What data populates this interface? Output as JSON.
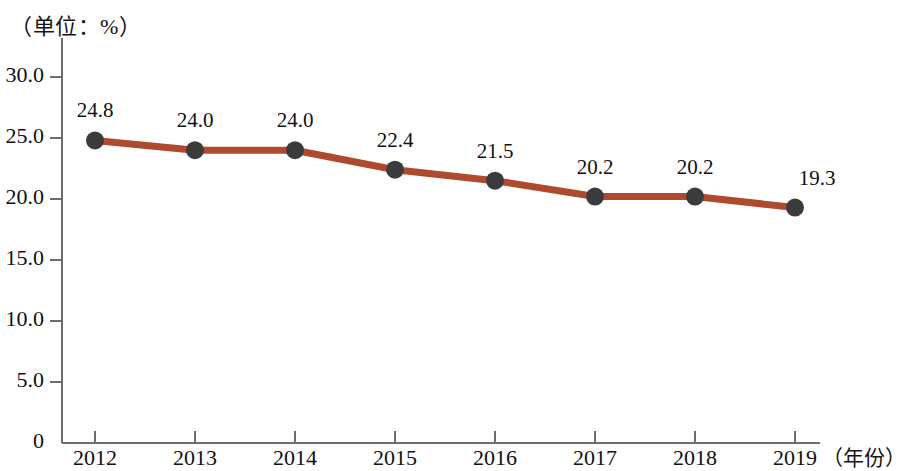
{
  "chart_data": {
    "type": "line",
    "title": "（单位：%）",
    "xlabel": "（年份）",
    "ylabel": "",
    "categories": [
      "2012",
      "2013",
      "2014",
      "2015",
      "2016",
      "2017",
      "2018",
      "2019"
    ],
    "values": [
      24.8,
      24.0,
      24.0,
      22.4,
      21.5,
      20.2,
      20.2,
      19.3
    ],
    "point_labels": [
      "24.8",
      "24.0",
      "24.0",
      "22.4",
      "21.5",
      "20.2",
      "20.2",
      "19.3"
    ],
    "series": [
      {
        "name": "",
        "values": [
          24.8,
          24.0,
          24.0,
          22.4,
          21.5,
          20.2,
          20.2,
          19.3
        ]
      }
    ],
    "ylim": [
      0,
      30
    ],
    "yticks": [
      0,
      5,
      10,
      15,
      20,
      25,
      30
    ],
    "ytick_labels": [
      "0",
      "5.0",
      "10.0",
      "15.0",
      "20.0",
      "25.0",
      "30.0"
    ],
    "grid": false,
    "legend": false,
    "line_color": "#b04a2f",
    "marker_color": "#3b3b3b",
    "axis_color": "#6e6e6e",
    "text_color": "#111111",
    "background_color": "#ffffff"
  }
}
